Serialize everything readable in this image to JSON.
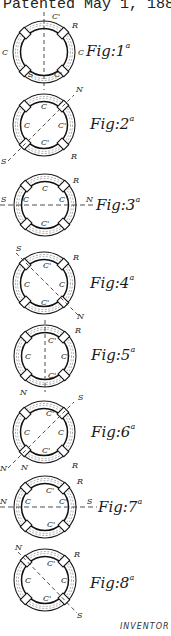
{
  "header": {
    "text": "Patented May 1, 1888."
  },
  "figures": [
    {
      "id": 1,
      "label": "Fig:1",
      "suffix": "a",
      "axis": "vertical",
      "pole_labels": [
        "C'",
        "R",
        "C",
        "C",
        "S",
        "C'"
      ]
    },
    {
      "id": 2,
      "label": "Fig:2",
      "suffix": "a",
      "axis": "diagonal-ne",
      "pole_labels": [
        "N",
        "C",
        "C",
        "C'",
        "C'",
        "S",
        "R"
      ]
    },
    {
      "id": 3,
      "label": "Fig:3",
      "suffix": "a",
      "axis": "horizontal",
      "pole_labels": [
        "R",
        "C",
        "C",
        "C'",
        "C'",
        "S",
        "N"
      ]
    },
    {
      "id": 4,
      "label": "Fig:4",
      "suffix": "a",
      "axis": "diagonal-nw",
      "pole_labels": [
        "S",
        "R",
        "C'",
        "C",
        "C",
        "C'",
        "N"
      ]
    },
    {
      "id": 5,
      "label": "Fig:5",
      "suffix": "a",
      "axis": "vertical",
      "pole_labels": [
        "R",
        "C'",
        "C",
        "C",
        "C'"
      ]
    },
    {
      "id": 6,
      "label": "Fig:6",
      "suffix": "a",
      "axis": "diagonal-ne",
      "pole_labels": [
        "S",
        "C'",
        "C",
        "C",
        "C'",
        "N",
        "R"
      ]
    },
    {
      "id": 7,
      "label": "Fig:7",
      "suffix": "a",
      "axis": "horizontal",
      "pole_labels": [
        "R",
        "C'",
        "C",
        "C",
        "C'",
        "N",
        "S"
      ]
    },
    {
      "id": 8,
      "label": "Fig:8",
      "suffix": "a",
      "axis": "diagonal-nw",
      "pole_labels": [
        "N",
        "R",
        "C'",
        "C",
        "C",
        "C'",
        "S"
      ]
    }
  ],
  "footer": {
    "inventor_label": "INVENTOR"
  },
  "colors": {
    "ink": "#1a1a1a",
    "paper": "#ffffff"
  }
}
